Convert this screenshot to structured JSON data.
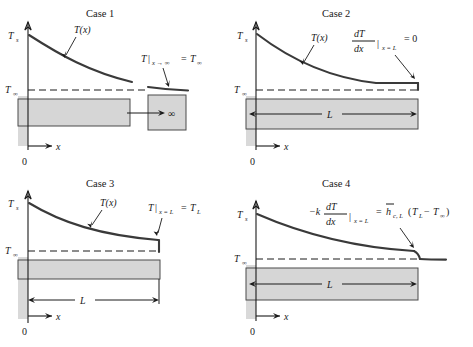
{
  "figure": {
    "axis": {
      "y_top_label": "T",
      "y_top_sub": "s",
      "y_bottom_label": "T",
      "y_bottom_sub": "∞",
      "x_label": "x",
      "origin_label": "0"
    },
    "colors": {
      "fin_fill": "#d6d6d6",
      "fin_edge": "#4a4a4a",
      "curve": "#3a3a3a",
      "ink": "#1a1a1a",
      "background": "#ffffff"
    }
  },
  "cases": [
    {
      "id": "case-1",
      "title": "Case 1",
      "curve_label": "T(x)",
      "length_label": "∞",
      "condition": {
        "full": "T|x → ∞ = T∞",
        "lhs_symbol": "T",
        "bar": "|",
        "subscript": "x → ∞",
        "equals": "=",
        "rhs_symbol": "T",
        "rhs_sub": "∞"
      },
      "description": "Infinitely long fin; tip temperature approaches the fluid temperature"
    },
    {
      "id": "case-2",
      "title": "Case 2",
      "curve_label": "T(x)",
      "length_label": "L",
      "condition": {
        "full": "dT/dx|x = L = 0",
        "numerator": "dT",
        "denominator": "dx",
        "bar": "|",
        "subscript": "x = L",
        "equals": "= 0"
      },
      "description": "Adiabatic (insulated) fin tip; zero temperature gradient at x = L"
    },
    {
      "id": "case-3",
      "title": "Case 3",
      "curve_label": "T(x)",
      "length_label": "L",
      "condition": {
        "full": "T|x = L = TL",
        "lhs_symbol": "T",
        "bar": "|",
        "subscript": "x = L",
        "equals": "=",
        "rhs_symbol": "T",
        "rhs_sub": "L"
      },
      "description": "Prescribed tip temperature at x = L"
    },
    {
      "id": "case-4",
      "title": "Case 4",
      "curve_label": "",
      "length_label": "L",
      "condition": {
        "full": "−k dT/dx|x = L = h̄c,L(TL − T∞)",
        "minus_k": "−k",
        "numerator": "dT",
        "denominator": "dx",
        "bar": "|",
        "subscript": "x = L",
        "equals": "=",
        "h_symbol": "h",
        "h_sub": "c, L",
        "paren_open": "(",
        "T_L": "T",
        "T_L_sub": "L",
        "minus": "−",
        "T_inf": "T",
        "T_inf_sub": "∞",
        "paren_close": ")"
      },
      "description": "Convection from the fin tip at x = L"
    }
  ]
}
